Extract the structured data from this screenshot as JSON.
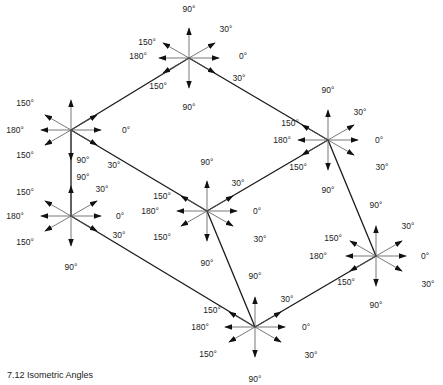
{
  "caption": "7.12 Isometric Angles",
  "colors": {
    "line": "#1a1a1a",
    "thin": "#555555",
    "text": "#222222",
    "background": "#ffffff"
  },
  "arrow_length": 30,
  "stars": [
    {
      "id": "top",
      "cx": 189,
      "cy": 58,
      "labels": [
        {
          "t": "90°",
          "x": 189,
          "y": 12
        },
        {
          "t": "30°",
          "x": 226,
          "y": 32
        },
        {
          "t": "0°",
          "x": 243,
          "y": 59
        },
        {
          "t": "30°",
          "x": 239,
          "y": 81
        },
        {
          "t": "90°",
          "x": 189,
          "y": 110
        },
        {
          "t": "150°",
          "x": 158,
          "y": 89
        },
        {
          "t": "180°",
          "x": 138,
          "y": 59
        },
        {
          "t": "150°",
          "x": 147,
          "y": 45
        }
      ]
    },
    {
      "id": "upper-left",
      "cx": 71,
      "cy": 130,
      "labels": [
        {
          "t": "150°",
          "x": 25,
          "y": 106
        },
        {
          "t": "180°",
          "x": 15,
          "y": 133
        },
        {
          "t": "0°",
          "x": 126,
          "y": 133
        },
        {
          "t": "150°",
          "x": 25,
          "y": 158
        },
        {
          "t": "30°",
          "x": 114,
          "y": 168
        },
        {
          "t": "90°",
          "x": 83,
          "y": 163
        }
      ]
    },
    {
      "id": "lower-left",
      "cx": 71,
      "cy": 216,
      "labels": [
        {
          "t": "90°",
          "x": 83,
          "y": 180
        },
        {
          "t": "150°",
          "x": 25,
          "y": 195
        },
        {
          "t": "30°",
          "x": 102,
          "y": 192
        },
        {
          "t": "180°",
          "x": 15,
          "y": 219
        },
        {
          "t": "0°",
          "x": 120,
          "y": 219
        },
        {
          "t": "150°",
          "x": 25,
          "y": 245
        },
        {
          "t": "30°",
          "x": 119,
          "y": 238
        },
        {
          "t": "90°",
          "x": 71,
          "y": 270
        }
      ]
    },
    {
      "id": "center",
      "cx": 207,
      "cy": 211,
      "labels": [
        {
          "t": "90°",
          "x": 207,
          "y": 165
        },
        {
          "t": "30°",
          "x": 238,
          "y": 186
        },
        {
          "t": "150°",
          "x": 162,
          "y": 199
        },
        {
          "t": "180°",
          "x": 150,
          "y": 214
        },
        {
          "t": "0°",
          "x": 257,
          "y": 214
        },
        {
          "t": "150°",
          "x": 162,
          "y": 240
        },
        {
          "t": "30°",
          "x": 260,
          "y": 242
        },
        {
          "t": "90°",
          "x": 207,
          "y": 266
        }
      ]
    },
    {
      "id": "right",
      "cx": 328,
      "cy": 140,
      "labels": [
        {
          "t": "90°",
          "x": 328,
          "y": 93
        },
        {
          "t": "30°",
          "x": 360,
          "y": 115
        },
        {
          "t": "150°",
          "x": 290,
          "y": 126
        },
        {
          "t": "180°",
          "x": 282,
          "y": 143
        },
        {
          "t": "0°",
          "x": 379,
          "y": 143
        },
        {
          "t": "150°",
          "x": 298,
          "y": 170
        },
        {
          "t": "30°",
          "x": 382,
          "y": 170
        },
        {
          "t": "90°",
          "x": 328,
          "y": 193
        }
      ]
    },
    {
      "id": "far-right",
      "cx": 376,
      "cy": 256,
      "labels": [
        {
          "t": "90°",
          "x": 376,
          "y": 208
        },
        {
          "t": "30°",
          "x": 408,
          "y": 229
        },
        {
          "t": "150°",
          "x": 333,
          "y": 241
        },
        {
          "t": "180°",
          "x": 318,
          "y": 259
        },
        {
          "t": "0°",
          "x": 425,
          "y": 259
        },
        {
          "t": "150°",
          "x": 346,
          "y": 285
        },
        {
          "t": "30°",
          "x": 428,
          "y": 287
        },
        {
          "t": "90°",
          "x": 376,
          "y": 308
        }
      ]
    },
    {
      "id": "bottom",
      "cx": 255,
      "cy": 327,
      "labels": [
        {
          "t": "90°",
          "x": 255,
          "y": 279
        },
        {
          "t": "30°",
          "x": 287,
          "y": 302
        },
        {
          "t": "150°",
          "x": 212,
          "y": 313
        },
        {
          "t": "180°",
          "x": 200,
          "y": 330
        },
        {
          "t": "0°",
          "x": 306,
          "y": 330
        },
        {
          "t": "150°",
          "x": 208,
          "y": 357
        },
        {
          "t": "30°",
          "x": 311,
          "y": 358
        },
        {
          "t": "90°",
          "x": 255,
          "y": 382
        }
      ]
    }
  ],
  "connectors": [
    {
      "from": "upper-left",
      "to": "top"
    },
    {
      "from": "top",
      "to": "right"
    },
    {
      "from": "upper-left",
      "to": "center"
    },
    {
      "from": "center",
      "to": "right"
    },
    {
      "from": "right",
      "to": "far-right"
    },
    {
      "from": "lower-left",
      "to": "bottom"
    },
    {
      "from": "center",
      "to": "bottom"
    },
    {
      "from": "bottom",
      "to": "far-right"
    },
    {
      "from": "upper-left",
      "to": "lower-left"
    }
  ]
}
